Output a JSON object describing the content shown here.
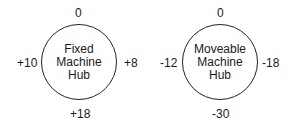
{
  "hubs": [
    {
      "name": "Fixed Machine Hub",
      "label_lines": [
        "Fixed",
        "Machine",
        "Hub"
      ],
      "values": {
        "top": "0",
        "left": "+10",
        "right": "+8",
        "bottom": "+18"
      }
    },
    {
      "name": "Moveable Machine Hub",
      "label_lines": [
        "Moveable",
        "Machine",
        "Hub"
      ],
      "values": {
        "top": "0",
        "left": "-12",
        "right": "-18",
        "bottom": "-30"
      }
    }
  ]
}
